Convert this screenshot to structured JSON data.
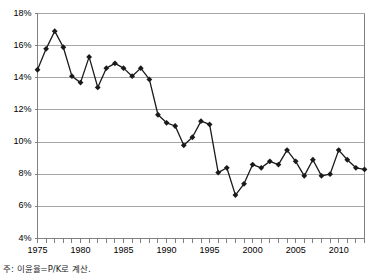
{
  "caption": {
    "note": "주: 이윤율=P/K로 계산."
  },
  "axis": {
    "y_ticks": [
      "4%",
      "6%",
      "8%",
      "10%",
      "12%",
      "14%",
      "16%",
      "18%"
    ],
    "x_ticks": [
      "1975",
      "1980",
      "1985",
      "1990",
      "1995",
      "2000",
      "2005",
      "2010"
    ]
  },
  "style": {
    "line_color": "#1a1a1a",
    "marker_color": "#1a1a1a",
    "grid_color": "#a6a6a6",
    "axis_color": "#808080",
    "background": "#ffffff"
  },
  "chart_data": {
    "type": "line",
    "title": "",
    "subtitle": "",
    "xlabel": "",
    "ylabel": "",
    "xlim": [
      1975,
      2013
    ],
    "ylim": [
      4,
      18
    ],
    "y_tick_values": [
      4,
      6,
      8,
      10,
      12,
      14,
      16,
      18
    ],
    "x_tick_values": [
      1975,
      1980,
      1985,
      1990,
      1995,
      2000,
      2005,
      2010
    ],
    "y_unit": "%",
    "grid": "horizontal",
    "legend": "none",
    "markers": "diamond",
    "annotations": [
      "주: 이윤율=P/K로 계산."
    ],
    "series": [
      {
        "name": "이윤율 (P/K)",
        "x": [
          1975,
          1976,
          1977,
          1978,
          1979,
          1980,
          1981,
          1982,
          1983,
          1984,
          1985,
          1986,
          1987,
          1988,
          1989,
          1990,
          1991,
          1992,
          1993,
          1994,
          1995,
          1996,
          1997,
          1998,
          1999,
          2000,
          2001,
          2002,
          2003,
          2004,
          2005,
          2006,
          2007,
          2008,
          2009,
          2010,
          2011,
          2012,
          2013
        ],
        "values": [
          14.5,
          15.8,
          16.9,
          15.9,
          14.1,
          13.7,
          15.3,
          13.4,
          14.6,
          14.9,
          14.6,
          14.1,
          14.6,
          13.9,
          11.7,
          11.2,
          11.0,
          9.8,
          10.3,
          11.3,
          11.1,
          8.1,
          8.4,
          6.7,
          7.4,
          8.6,
          8.4,
          8.8,
          8.6,
          9.5,
          8.8,
          7.9,
          8.9,
          7.9,
          8.0,
          9.5,
          8.9,
          8.4,
          8.3
        ]
      }
    ]
  }
}
